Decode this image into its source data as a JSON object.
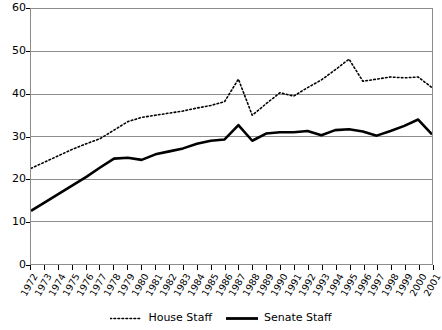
{
  "chart_data": {
    "type": "line",
    "title": "",
    "subtitle": "",
    "xlabel": "",
    "ylabel": "",
    "ylim": [
      0,
      60
    ],
    "ytick_labels": [
      "0",
      "10",
      "20",
      "30",
      "40",
      "50",
      "60"
    ],
    "ytick_values": [
      0,
      10,
      20,
      30,
      40,
      50,
      60
    ],
    "grid": true,
    "grid_axis": "y",
    "legend_position": "bottom-center",
    "categories": [
      "1972",
      "1973",
      "1974",
      "1975",
      "1976",
      "1977",
      "1978",
      "1979",
      "1980",
      "1981",
      "1982",
      "1983",
      "1984",
      "1985",
      "1986",
      "1987",
      "1988",
      "1989",
      "1990",
      "1991",
      "1992",
      "1993",
      "1994",
      "1995",
      "1996",
      "1997",
      "1998",
      "1999",
      "2000",
      "2001"
    ],
    "series": [
      {
        "name": "House Staff",
        "style": "dotted",
        "color": "#000000",
        "values": [
          22.5,
          24.0,
          25.5,
          27.0,
          28.3,
          29.5,
          31.5,
          33.5,
          34.5,
          35.0,
          35.5,
          36.0,
          36.7,
          37.3,
          38.2,
          43.5,
          35.0,
          37.7,
          40.3,
          39.5,
          41.5,
          43.3,
          45.7,
          48.2,
          43.0,
          43.5,
          44.0,
          43.8,
          44.0,
          41.5
        ]
      },
      {
        "name": "Senate Staff",
        "style": "solid",
        "color": "#000000",
        "values": [
          12.5,
          14.5,
          16.5,
          18.5,
          20.5,
          22.7,
          24.8,
          25.0,
          24.5,
          25.8,
          26.5,
          27.2,
          28.3,
          29.0,
          29.3,
          32.7,
          29.0,
          30.7,
          31.0,
          31.0,
          31.3,
          30.3,
          31.5,
          31.7,
          31.2,
          30.2,
          31.3,
          32.5,
          34.0,
          30.5
        ]
      }
    ]
  },
  "legend": {
    "entries": [
      {
        "label": "House Staff",
        "icon": "dotted-line-swatch"
      },
      {
        "label": "Senate Staff",
        "icon": "solid-line-swatch"
      }
    ]
  },
  "colors": {
    "line": "#000000",
    "grid": "#8c8c8c",
    "axis": "#000000",
    "background": "#ffffff"
  }
}
